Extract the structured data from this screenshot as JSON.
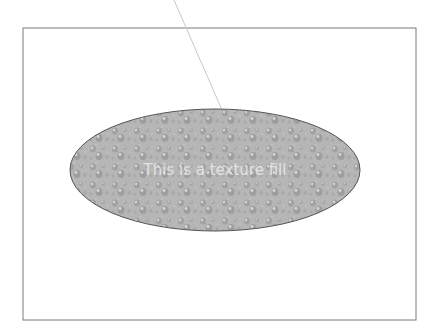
{
  "slide": {
    "frame": {
      "x": 23,
      "y": 28,
      "width": 393,
      "height": 292,
      "stroke": "#7a7a7a"
    },
    "connector_line": {
      "x1": 174,
      "y1": 0,
      "x2": 222,
      "y2": 110,
      "stroke": "#c8c8c8"
    },
    "ellipse": {
      "cx": 215,
      "cy": 170,
      "rx": 145,
      "ry": 61,
      "fill": "#b4b4b4",
      "stroke": "#555555",
      "label": "This is a texture fill",
      "label_color": "#e2e2e2"
    }
  }
}
